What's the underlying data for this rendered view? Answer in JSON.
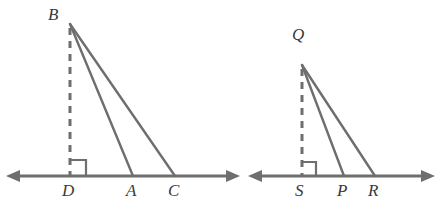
{
  "figure": {
    "background_color": "#ffffff",
    "stroke_color": "#6e6e6e",
    "label_color": "#3a3a3a",
    "baseline_stroke_width": 3,
    "triangle_stroke_width": 2.4,
    "dashed_stroke_width": 3,
    "dash_pattern": "7,6"
  },
  "panels": [
    {
      "name": "left-figure",
      "baseline": {
        "name": "baseline-DC",
        "y": 176,
        "x_start": 8,
        "x_end": 238,
        "arrow_start": "left",
        "arrow_end": "right"
      },
      "apex": {
        "name": "B",
        "label": "B",
        "x": 70,
        "y": 24,
        "label_x": 48,
        "label_y": 6
      },
      "foot": {
        "name": "D",
        "label": "D",
        "x": 70,
        "y": 176,
        "label_x": 62,
        "label_y": 182
      },
      "points": [
        {
          "name": "A",
          "label": "A",
          "x": 133,
          "y": 176,
          "label_x": 126,
          "label_y": 182
        },
        {
          "name": "C",
          "label": "C",
          "x": 175,
          "y": 176,
          "label_x": 168,
          "label_y": 182
        }
      ],
      "altitude": {
        "name": "altitude-BD",
        "dashed": true,
        "from": "B",
        "to": "D"
      },
      "sides": [
        {
          "name": "segment-BA",
          "from": "B",
          "to": "A"
        },
        {
          "name": "segment-BC",
          "from": "B",
          "to": "C"
        }
      ],
      "right_angle": {
        "name": "right-angle-marker-D",
        "vertex_x": 70,
        "vertex_y": 176,
        "size": 16,
        "opens": "right"
      }
    },
    {
      "name": "right-figure",
      "baseline": {
        "name": "baseline-SR",
        "y": 176,
        "x_start": 250,
        "x_end": 433,
        "arrow_start": "left",
        "arrow_end": "right"
      },
      "apex": {
        "name": "Q",
        "label": "Q",
        "x": 302,
        "y": 65,
        "label_x": 292,
        "label_y": 26
      },
      "foot": {
        "name": "S",
        "label": "S",
        "x": 302,
        "y": 176,
        "label_x": 295,
        "label_y": 182
      },
      "points": [
        {
          "name": "P",
          "label": "P",
          "x": 344,
          "y": 176,
          "label_x": 337,
          "label_y": 182
        },
        {
          "name": "R",
          "label": "R",
          "x": 375,
          "y": 176,
          "label_x": 368,
          "label_y": 182
        }
      ],
      "altitude": {
        "name": "altitude-QS",
        "dashed": true,
        "from": "Q",
        "to": "S"
      },
      "sides": [
        {
          "name": "segment-QP",
          "from": "Q",
          "to": "P"
        },
        {
          "name": "segment-QR",
          "from": "Q",
          "to": "R"
        }
      ],
      "right_angle": {
        "name": "right-angle-marker-S",
        "vertex_x": 302,
        "vertex_y": 176,
        "size": 14,
        "opens": "right"
      }
    }
  ]
}
